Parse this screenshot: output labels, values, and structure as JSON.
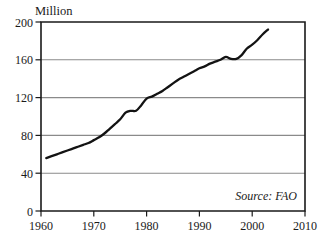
{
  "chart_data": {
    "type": "line",
    "title": "",
    "unit_label": "Million",
    "xlabel": "",
    "ylabel": "",
    "xlim": [
      1960,
      2010
    ],
    "ylim": [
      0,
      200
    ],
    "x_ticks": [
      1960,
      1970,
      1980,
      1990,
      2000,
      2010
    ],
    "y_ticks": [
      0,
      40,
      80,
      120,
      160,
      200
    ],
    "grid": "horizontal",
    "legend": "none",
    "annotations": [
      {
        "name": "source-note",
        "text": "Source: FAO",
        "position": "bottom-right-inside"
      }
    ],
    "series": [
      {
        "name": "Million",
        "color": "#131313",
        "x": [
          1961,
          1962,
          1963,
          1964,
          1965,
          1966,
          1967,
          1968,
          1969,
          1970,
          1971,
          1972,
          1973,
          1974,
          1975,
          1976,
          1977,
          1978,
          1979,
          1980,
          1981,
          1982,
          1983,
          1984,
          1985,
          1986,
          1987,
          1988,
          1989,
          1990,
          1991,
          1992,
          1993,
          1994,
          1995,
          1996,
          1997,
          1998,
          1999,
          2000,
          2001,
          2002,
          2003
        ],
        "values": [
          56,
          58,
          60,
          62,
          64,
          66,
          68,
          70,
          72,
          75,
          78,
          82,
          87,
          92,
          97,
          104,
          106,
          106,
          112,
          119,
          121,
          124,
          127,
          131,
          135,
          139,
          142,
          145,
          148,
          151,
          153,
          156,
          158,
          160,
          163,
          161,
          161,
          165,
          172,
          176,
          181,
          187,
          192
        ]
      }
    ]
  },
  "axis": {
    "y_tick_labels": [
      "200",
      "160",
      "120",
      "80",
      "40",
      "0"
    ],
    "x_tick_labels": [
      "1960",
      "1970",
      "1980",
      "1990",
      "2000",
      "2010"
    ]
  },
  "colors": {
    "line": "#131313",
    "grid": "#8a8a8a",
    "frame": "#1a1a1a",
    "background": "#ffffff"
  }
}
